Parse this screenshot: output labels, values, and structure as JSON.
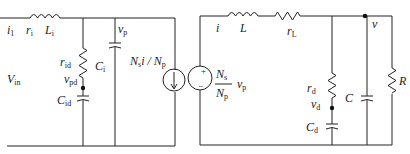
{
  "diagram": {
    "type": "circuit-schematic",
    "left_circuit": {
      "labels": {
        "input_current": "i",
        "input_current_sub": "1",
        "input_resistance": "r",
        "input_resistance_sub": "i",
        "input_inductance": "L",
        "input_inductance_sub": "i",
        "input_voltage": "V",
        "input_voltage_sub": "in",
        "damping_resistance": "r",
        "damping_resistance_sub": "id",
        "damping_node_voltage": "v",
        "damping_node_voltage_sub": "pd",
        "damping_capacitance": "C",
        "damping_capacitance_sub": "id",
        "input_capacitance": "C",
        "input_capacitance_sub": "i",
        "primary_voltage": "v",
        "primary_voltage_sub": "p"
      }
    },
    "transformer_model": {
      "current_source_label": "N",
      "current_source_label_sub": "s",
      "current_source_label_mid": "i / N",
      "current_source_label_sub2": "p",
      "voltage_source_plus": "+",
      "voltage_source_minus": "−",
      "ratio_numerator": "N",
      "ratio_numerator_sub": "s",
      "ratio_denominator": "N",
      "ratio_denominator_sub": "p",
      "ratio_variable": "v",
      "ratio_variable_sub": "p"
    },
    "right_circuit": {
      "labels": {
        "output_current": "i",
        "inductance": "L",
        "inductor_resistance": "r",
        "inductor_resistance_sub": "L",
        "output_voltage": "v",
        "damping_resistance": "r",
        "damping_resistance_sub": "d",
        "damping_node_voltage": "v",
        "damping_node_voltage_sub": "d",
        "damping_capacitance": "C",
        "damping_capacitance_sub": "d",
        "output_capacitance": "C",
        "load_resistance": "R"
      }
    }
  }
}
